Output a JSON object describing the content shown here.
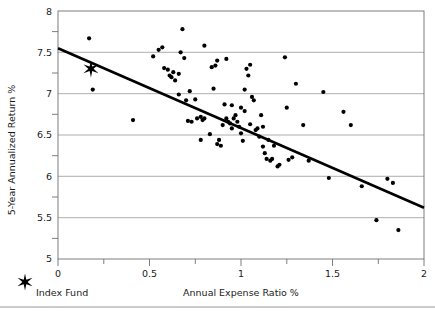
{
  "chart_data": {
    "type": "scatter",
    "title": "",
    "xlabel": "Annual Expense Ratio %",
    "ylabel": "5-Year Annualized Return %",
    "xlim": [
      0,
      2
    ],
    "ylim": [
      5,
      8
    ],
    "xticks": [
      0,
      0.5,
      1,
      1.5,
      2
    ],
    "xtick_labels": [
      "0",
      "0.5",
      "1",
      "1.5",
      "2"
    ],
    "xminor_ticks": [
      0.25,
      0.75,
      1.25,
      1.75
    ],
    "yticks": [
      5,
      5.5,
      6,
      6.5,
      7,
      7.5,
      8
    ],
    "ytick_labels": [
      "5",
      "5.5",
      "6",
      "6.5",
      "7",
      "7.5",
      "8"
    ],
    "yminor_ticks": [
      5.25,
      5.75,
      6.25,
      6.75,
      7.25,
      7.75
    ],
    "grid": true,
    "grid_axis": "y",
    "legend_position": "below-left",
    "series": [
      {
        "name": "Funds",
        "marker": "circle",
        "color": "#000000",
        "points": [
          [
            0.17,
            7.67
          ],
          [
            0.19,
            7.05
          ],
          [
            0.52,
            7.45
          ],
          [
            0.55,
            7.53
          ],
          [
            0.57,
            7.56
          ],
          [
            0.58,
            7.31
          ],
          [
            0.6,
            7.29
          ],
          [
            0.61,
            7.22
          ],
          [
            0.62,
            7.2
          ],
          [
            0.63,
            7.26
          ],
          [
            0.64,
            7.16
          ],
          [
            0.66,
            6.99
          ],
          [
            0.67,
            7.5
          ],
          [
            0.68,
            7.78
          ],
          [
            0.69,
            7.43
          ],
          [
            0.7,
            6.92
          ],
          [
            0.71,
            6.67
          ],
          [
            0.73,
            6.66
          ],
          [
            0.75,
            6.93
          ],
          [
            0.76,
            6.7
          ],
          [
            0.78,
            6.72
          ],
          [
            0.79,
            6.68
          ],
          [
            0.8,
            6.7
          ],
          [
            0.41,
            6.68
          ],
          [
            0.83,
            6.51
          ],
          [
            0.84,
            7.32
          ],
          [
            0.85,
            7.06
          ],
          [
            0.86,
            7.34
          ],
          [
            0.87,
            6.39
          ],
          [
            0.88,
            6.44
          ],
          [
            0.89,
            6.37
          ],
          [
            0.9,
            6.62
          ],
          [
            0.91,
            6.87
          ],
          [
            0.92,
            6.7
          ],
          [
            0.93,
            6.66
          ],
          [
            0.94,
            6.64
          ],
          [
            0.95,
            6.58
          ],
          [
            0.96,
            6.7
          ],
          [
            0.97,
            6.74
          ],
          [
            0.98,
            6.66
          ],
          [
            0.99,
            6.6
          ],
          [
            1.0,
            6.52
          ],
          [
            1.01,
            6.43
          ],
          [
            1.02,
            6.79
          ],
          [
            1.03,
            7.3
          ],
          [
            1.04,
            7.22
          ],
          [
            1.05,
            7.35
          ],
          [
            1.06,
            6.96
          ],
          [
            1.07,
            6.92
          ],
          [
            1.08,
            6.56
          ],
          [
            1.09,
            6.58
          ],
          [
            1.1,
            6.48
          ],
          [
            1.11,
            6.74
          ],
          [
            1.12,
            6.6
          ],
          [
            1.13,
            6.28
          ],
          [
            1.14,
            6.21
          ],
          [
            1.15,
            6.44
          ],
          [
            1.16,
            6.19
          ],
          [
            1.17,
            6.21
          ],
          [
            1.18,
            6.37
          ],
          [
            1.2,
            6.12
          ],
          [
            1.21,
            6.14
          ],
          [
            1.24,
            7.44
          ],
          [
            1.25,
            6.83
          ],
          [
            1.26,
            6.2
          ],
          [
            1.28,
            6.23
          ],
          [
            1.3,
            7.12
          ],
          [
            1.34,
            6.62
          ],
          [
            1.37,
            6.19
          ],
          [
            1.45,
            7.02
          ],
          [
            1.48,
            5.98
          ],
          [
            1.56,
            6.78
          ],
          [
            1.6,
            6.62
          ],
          [
            1.66,
            5.88
          ],
          [
            1.74,
            5.47
          ],
          [
            1.8,
            5.97
          ],
          [
            1.83,
            5.92
          ],
          [
            1.86,
            5.35
          ],
          [
            0.87,
            7.4
          ],
          [
            0.8,
            7.58
          ],
          [
            1.12,
            6.36
          ],
          [
            0.66,
            7.24
          ],
          [
            0.78,
            6.44
          ],
          [
            0.95,
            6.86
          ],
          [
            1.0,
            6.83
          ],
          [
            1.05,
            6.63
          ],
          [
            0.72,
            7.03
          ],
          [
            0.92,
            7.42
          ],
          [
            1.02,
            7.05
          ]
        ]
      }
    ],
    "highlight_point": {
      "name": "Index Fund",
      "marker": "star",
      "x": 0.18,
      "y": 7.3,
      "color": "#000000"
    },
    "trendline": {
      "type": "linear",
      "x_start": 0,
      "y_start": 7.55,
      "x_end": 2,
      "y_end": 5.62,
      "color": "#000000"
    }
  },
  "legend": {
    "index_fund_label": "Index Fund",
    "star_glyph": "star-marker"
  }
}
